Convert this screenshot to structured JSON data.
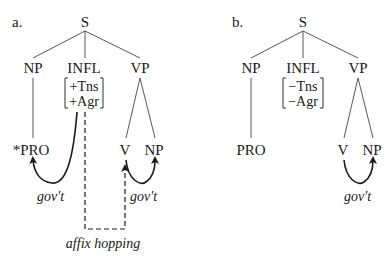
{
  "diagrams": {
    "a": {
      "label": "a.",
      "root": "S",
      "np": "NP",
      "infl": "INFL",
      "infl_features": [
        "+Tns",
        "+Agr"
      ],
      "vp": "VP",
      "subject": "*PRO",
      "verb": "V",
      "object": "NP",
      "gov_left": "gov't",
      "gov_right": "gov't",
      "affix_hopping": "affix hopping"
    },
    "b": {
      "label": "b.",
      "root": "S",
      "np": "NP",
      "infl": "INFL",
      "infl_features": [
        "−Tns",
        "−Agr"
      ],
      "vp": "VP",
      "subject": "PRO",
      "verb": "V",
      "object": "NP",
      "gov_right": "gov't"
    }
  },
  "colors": {
    "ink": "#1a1a1a",
    "edge": "#444444",
    "background": "#ffffff"
  }
}
